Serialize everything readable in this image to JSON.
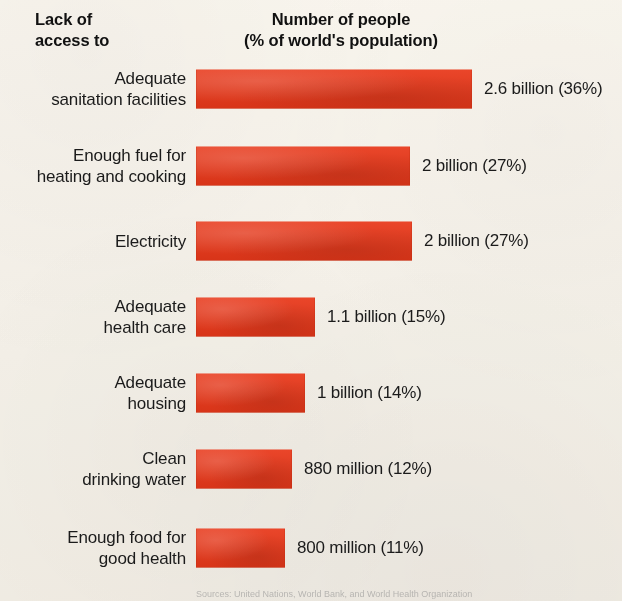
{
  "figure": {
    "width": 622,
    "height": 601,
    "background_color": "#faf8f4",
    "bar_color": "#e8381a",
    "text_color": "#1b1b1b"
  },
  "headers": {
    "left": "Lack of\naccess to",
    "right": "Number of people\n(% of world's population)"
  },
  "source_note": "Sources: United Nations, World Bank, and World Health Organization",
  "chart_data": {
    "type": "bar",
    "orientation": "horizontal",
    "title": "Number of people (% of world's population)",
    "xlabel": "",
    "ylabel": "Lack of access to",
    "grid": false,
    "legend": "none",
    "value_unit": "people",
    "xlim": [
      0,
      2.6
    ],
    "categories": [
      "Adequate\nsanitation facilities",
      "Enough fuel for\nheating and cooking",
      "Electricity",
      "Adequate\nhealth care",
      "Adequate\nhousing",
      "Clean\ndrinking water",
      "Enough food for\ngood health"
    ],
    "values": [
      2.6,
      2.0,
      2.0,
      1.1,
      1.0,
      0.88,
      0.8
    ],
    "percent_of_world_population": [
      36,
      27,
      27,
      15,
      14,
      12,
      11
    ],
    "value_labels": [
      "2.6 billion (36%)",
      "2 billion (27%)",
      "2 billion (27%)",
      "1.1 billion (15%)",
      "1 billion (14%)",
      "880 million (12%)",
      "800 million (11%)"
    ],
    "bar_pixel_widths": [
      276,
      214,
      216,
      119,
      109,
      96,
      89
    ],
    "rows": [
      {
        "label": "Adequate\nsanitation facilities",
        "value_label": "2.6 billion (36%)",
        "value": 2.6,
        "percent": 36,
        "bar_width": 276,
        "top": 67
      },
      {
        "label": "Enough fuel for\nheating and cooking",
        "value_label": "2 billion (27%)",
        "value": 2.0,
        "percent": 27,
        "bar_width": 214,
        "top": 144
      },
      {
        "label": "Electricity",
        "value_label": "2 billion (27%)",
        "value": 2.0,
        "percent": 27,
        "bar_width": 216,
        "top": 219
      },
      {
        "label": "Adequate\nhealth care",
        "value_label": "1.1 billion (15%)",
        "value": 1.1,
        "percent": 15,
        "bar_width": 119,
        "top": 295
      },
      {
        "label": "Adequate\nhousing",
        "value_label": "1 billion (14%)",
        "value": 1.0,
        "percent": 14,
        "bar_width": 109,
        "top": 371
      },
      {
        "label": "Clean\ndrinking water",
        "value_label": "880 million (12%)",
        "value": 0.88,
        "percent": 12,
        "bar_width": 96,
        "top": 447
      },
      {
        "label": "Enough food for\ngood health",
        "value_label": "800 million (11%)",
        "value": 0.8,
        "percent": 11,
        "bar_width": 89,
        "top": 526
      }
    ]
  }
}
